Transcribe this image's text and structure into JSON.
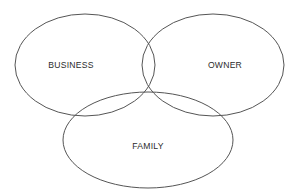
{
  "diagram": {
    "type": "venn",
    "title": "",
    "background_color": "#ffffff",
    "stroke_color": "#555555",
    "label_color": "#2b2b2b",
    "sets": [
      {
        "id": "business",
        "label": "BUSINESS",
        "position": "left",
        "center_x": 85,
        "center_y": 65,
        "radius_x": 70,
        "radius_y": 51,
        "label_x": 71,
        "label_y": 66
      },
      {
        "id": "owner",
        "label": "OWNER",
        "position": "right",
        "center_x": 213,
        "center_y": 65,
        "radius_x": 71,
        "radius_y": 51,
        "label_x": 225,
        "label_y": 66
      },
      {
        "id": "family",
        "label": "FAMILY",
        "position": "bottom",
        "center_x": 148,
        "center_y": 140,
        "radius_x": 85,
        "radius_y": 48,
        "label_x": 148,
        "label_y": 147
      }
    ]
  }
}
